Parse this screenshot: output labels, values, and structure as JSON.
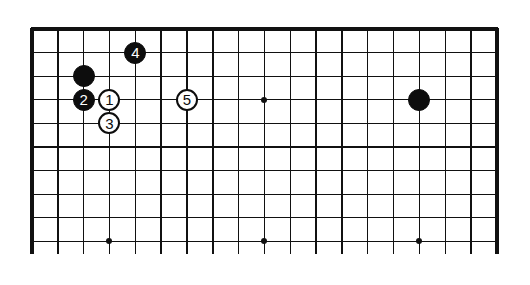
{
  "board": {
    "columns": 19,
    "visible_rows": 10,
    "origin_x": 32,
    "origin_y": 29,
    "spacing_x": 25.83,
    "spacing_y": 23.6,
    "line_extend_to_y": 254,
    "line_color": "#111111",
    "edges": [
      "top",
      "left",
      "right"
    ]
  },
  "hoshi": [
    {
      "col": 9,
      "row": 3
    },
    {
      "col": 3,
      "row": 9
    },
    {
      "col": 9,
      "row": 9
    },
    {
      "col": 15,
      "row": 9
    }
  ],
  "stones": [
    {
      "col": 2,
      "row": 2,
      "color": "black",
      "label": ""
    },
    {
      "col": 3,
      "row": 3,
      "color": "white",
      "label": "1"
    },
    {
      "col": 2,
      "row": 3,
      "color": "black",
      "label": "2"
    },
    {
      "col": 3,
      "row": 4,
      "color": "white",
      "label": "3"
    },
    {
      "col": 4,
      "row": 1,
      "color": "black",
      "label": "4"
    },
    {
      "col": 6,
      "row": 3,
      "color": "white",
      "label": "5"
    },
    {
      "col": 15,
      "row": 3,
      "color": "black",
      "label": ""
    }
  ]
}
